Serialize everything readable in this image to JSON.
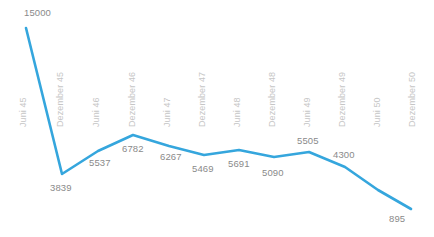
{
  "chart_data": {
    "type": "line",
    "title": "",
    "subtitle": "",
    "xlabel": "",
    "ylabel": "",
    "grid": false,
    "legend": "none",
    "line_color": "#35a6dd",
    "value_label_color": "#8a8a8a",
    "axis_label_color": "#c6c6c6",
    "axis_label_rotation": -90,
    "background": "#ffffff",
    "ylim": [
      0,
      15000
    ],
    "categories": [
      "Juni 45",
      "Dezember 45",
      "Juni 46",
      "Dezember 46",
      "Juni 47",
      "Dezember 47",
      "Juni 48",
      "Dezember 48",
      "Juni 49",
      "Dezember 49",
      "Juni 50",
      "Dezember 50"
    ],
    "values": [
      15000,
      3839,
      5537,
      6782,
      6267,
      5469,
      5691,
      5090,
      5505,
      4300,
      2600,
      895
    ],
    "point_labels": [
      "15000",
      "3839",
      "5537",
      "6782",
      "6267",
      "5469",
      "5691",
      "5090",
      "5505",
      "4300",
      "",
      "895"
    ]
  },
  "axis": {
    "ticks": [
      {
        "label": "Juni 45",
        "x": 28,
        "y": 118
      },
      {
        "label": "Dezember 45",
        "x": 65,
        "y": 118
      },
      {
        "label": "Juni 46",
        "x": 101,
        "y": 118
      },
      {
        "label": "Dezember 46",
        "x": 137,
        "y": 118
      },
      {
        "label": "Juni 47",
        "x": 172,
        "y": 118
      },
      {
        "label": "Dezember 47",
        "x": 207,
        "y": 118
      },
      {
        "label": "Juni 48",
        "x": 242,
        "y": 118
      },
      {
        "label": "Dezember 48",
        "x": 277,
        "y": 118
      },
      {
        "label": "Juni 49",
        "x": 312,
        "y": 118
      },
      {
        "label": "Dezember 49",
        "x": 347,
        "y": 118
      },
      {
        "label": "Juni 50",
        "x": 382,
        "y": 118
      },
      {
        "label": "Dezember 50",
        "x": 417,
        "y": 118
      }
    ]
  },
  "labels": {
    "items": [
      {
        "text": "15000",
        "x": 24,
        "y": 8
      },
      {
        "text": "3839",
        "x": 50,
        "y": 183
      },
      {
        "text": "5537",
        "x": 89,
        "y": 158
      },
      {
        "text": "6782",
        "x": 122,
        "y": 144
      },
      {
        "text": "6267",
        "x": 160,
        "y": 152
      },
      {
        "text": "5469",
        "x": 192,
        "y": 164
      },
      {
        "text": "5691",
        "x": 228,
        "y": 159
      },
      {
        "text": "5090",
        "x": 262,
        "y": 168
      },
      {
        "text": "5505",
        "x": 297,
        "y": 136
      },
      {
        "text": "4300",
        "x": 333,
        "y": 150
      },
      {
        "text": "895",
        "x": 389,
        "y": 214
      }
    ]
  },
  "series_points": [
    {
      "x": 26,
      "y": 28
    },
    {
      "x": 62,
      "y": 174
    },
    {
      "x": 98,
      "y": 151
    },
    {
      "x": 133,
      "y": 135
    },
    {
      "x": 169,
      "y": 146
    },
    {
      "x": 204,
      "y": 155
    },
    {
      "x": 239,
      "y": 150
    },
    {
      "x": 274,
      "y": 157
    },
    {
      "x": 309,
      "y": 152
    },
    {
      "x": 345,
      "y": 167
    },
    {
      "x": 378,
      "y": 190
    },
    {
      "x": 411,
      "y": 209
    }
  ]
}
